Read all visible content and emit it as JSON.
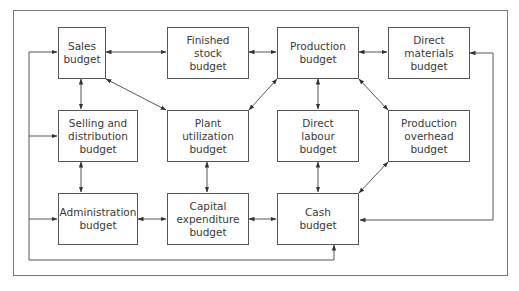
{
  "diagram": {
    "nodes": {
      "sales": {
        "label": "Sales\nbudget"
      },
      "finished_stock": {
        "label": "Finished\nstock\nbudget"
      },
      "production": {
        "label": "Production\nbudget"
      },
      "direct_materials": {
        "label": "Direct\nmaterials\nbudget"
      },
      "selling_distribution": {
        "label": "Selling and\ndistribution\nbudget"
      },
      "plant_utilization": {
        "label": "Plant\nutilization\nbudget"
      },
      "direct_labour": {
        "label": "Direct\nlabour\nbudget"
      },
      "production_overhead": {
        "label": "Production\noverhead\nbudget"
      },
      "administration": {
        "label": "Administration\nbudget"
      },
      "capital_expenditure": {
        "label": "Capital\nexpenditure\nbudget"
      },
      "cash": {
        "label": "Cash\nbudget"
      }
    },
    "edges": [
      {
        "from": "sales",
        "to": "finished_stock",
        "type": "bidirectional"
      },
      {
        "from": "finished_stock",
        "to": "production",
        "type": "bidirectional"
      },
      {
        "from": "production",
        "to": "direct_materials",
        "type": "bidirectional"
      },
      {
        "from": "sales",
        "to": "selling_distribution",
        "type": "bidirectional"
      },
      {
        "from": "sales",
        "to": "plant_utilization",
        "type": "bidirectional"
      },
      {
        "from": "plant_utilization",
        "to": "production",
        "type": "bidirectional"
      },
      {
        "from": "production",
        "to": "direct_labour",
        "type": "bidirectional"
      },
      {
        "from": "production",
        "to": "production_overhead",
        "type": "bidirectional"
      },
      {
        "from": "selling_distribution",
        "to": "administration",
        "type": "bidirectional"
      },
      {
        "from": "plant_utilization",
        "to": "capital_expenditure",
        "type": "bidirectional"
      },
      {
        "from": "direct_labour",
        "to": "cash",
        "type": "bidirectional"
      },
      {
        "from": "production_overhead",
        "to": "cash",
        "type": "bidirectional"
      },
      {
        "from": "administration",
        "to": "capital_expenditure",
        "type": "bidirectional"
      },
      {
        "from": "capital_expenditure",
        "to": "cash",
        "type": "bidirectional"
      },
      {
        "from": "cash",
        "to": "direct_materials",
        "type": "loop-right"
      },
      {
        "from": "cash",
        "to": [
          "sales",
          "selling_distribution",
          "administration"
        ],
        "type": "loop-left"
      }
    ]
  }
}
